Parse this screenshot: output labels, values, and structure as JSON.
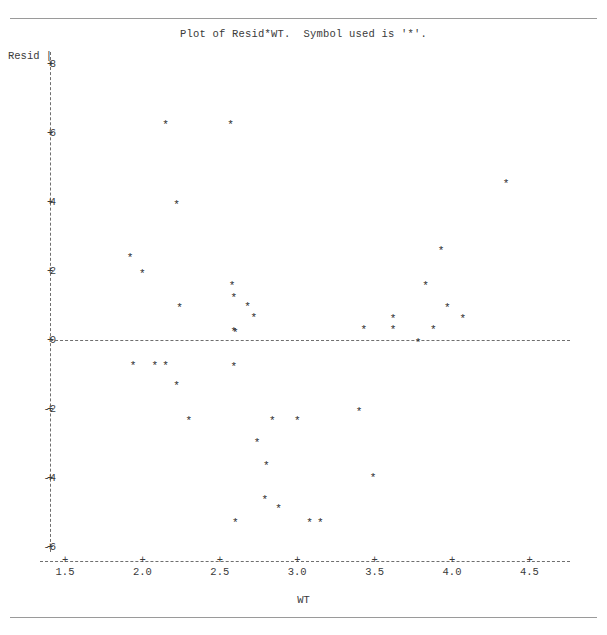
{
  "page": {
    "title_line": "Plot of Resid*WT.  Symbol used is '*'.",
    "symbol": "*"
  },
  "chart_data": {
    "type": "scatter",
    "title": "Plot of Resid*WT.  Symbol used is '*'.",
    "xlabel": "WT",
    "ylabel": "Resid",
    "xlim": [
      1.35,
      4.6
    ],
    "ylim": [
      -6.6,
      8.2
    ],
    "xticks": [
      1.5,
      2.0,
      2.5,
      3.0,
      3.5,
      4.0,
      4.5
    ],
    "xtick_labels": [
      "1.5",
      "2.0",
      "2.5",
      "3.0",
      "3.5",
      "4.0",
      "4.5"
    ],
    "yticks": [
      8,
      6,
      4,
      2,
      0,
      -2,
      -4,
      -6
    ],
    "ytick_labels": [
      "8",
      "6",
      "4",
      "2",
      "0",
      "-2",
      "-4",
      "-6"
    ],
    "grid": false,
    "legend": "none",
    "reference_lines": [
      {
        "axis": "y",
        "value": 0,
        "style": "dashed"
      }
    ],
    "marker": "*",
    "series": [
      {
        "name": "Resid vs WT",
        "x": [
          1.92,
          1.94,
          2.0,
          2.08,
          2.15,
          2.15,
          2.22,
          2.22,
          2.24,
          2.3,
          2.57,
          2.58,
          2.59,
          2.59,
          2.59,
          2.6,
          2.6,
          2.68,
          2.72,
          2.74,
          2.79,
          2.8,
          2.84,
          2.88,
          3.0,
          3.08,
          3.15,
          3.4,
          3.43,
          3.49,
          3.62,
          3.62,
          3.78,
          3.83,
          3.88,
          3.93,
          3.97,
          4.07,
          4.35
        ],
        "y": [
          2.45,
          -0.67,
          2.0,
          -0.67,
          6.3,
          -0.67,
          4.0,
          -1.25,
          1.0,
          -2.25,
          6.3,
          1.65,
          1.3,
          0.33,
          -0.7,
          0.3,
          -5.2,
          1.05,
          0.73,
          -2.9,
          -4.55,
          -3.55,
          -2.25,
          -4.8,
          -2.25,
          -5.2,
          -5.2,
          -2.0,
          0.37,
          -3.9,
          0.7,
          0.37,
          0.0,
          1.65,
          0.37,
          2.65,
          1.0,
          0.7,
          4.6
        ]
      }
    ]
  }
}
